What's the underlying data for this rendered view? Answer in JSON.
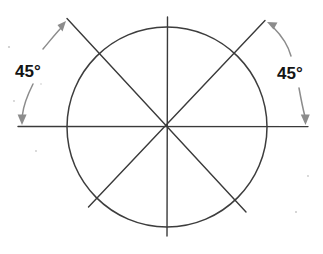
{
  "figure": {
    "background_color": "#ffffff",
    "line_color": "#3a3a3a",
    "arrow_color": "#8c8c8c",
    "text_color": "#141414"
  },
  "labels": {
    "left_angle": "45°",
    "right_angle": "45°"
  },
  "geometry": {
    "center": {
      "x": 167,
      "y": 127
    },
    "radius": 100,
    "sector_count": 8,
    "sector_angle_degrees": 45,
    "diameters": [
      {
        "name": "horizontal",
        "angle_degrees": 0
      },
      {
        "name": "diagonal-up-right",
        "angle_degrees": 45
      },
      {
        "name": "vertical",
        "angle_degrees": 90
      },
      {
        "name": "diagonal-up-left",
        "angle_degrees": 135
      }
    ]
  },
  "annotations": {
    "left": {
      "measured_between": [
        "horizontal-axis",
        "diagonal-up-left"
      ],
      "value": "45°"
    },
    "right": {
      "measured_between": [
        "horizontal-axis",
        "diagonal-up-right"
      ],
      "value": "45°"
    }
  }
}
